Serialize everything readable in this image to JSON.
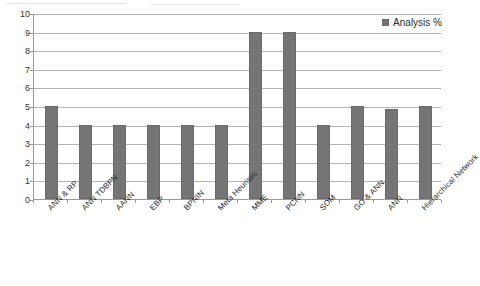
{
  "chart_data": {
    "type": "bar",
    "title": "",
    "xlabel": "",
    "ylabel": "",
    "ylim": [
      0,
      10
    ],
    "ytick_step": 1,
    "grid": true,
    "legend_position": "top-right",
    "bar_color": "#757575",
    "gridline_color": "#b4b4b4",
    "axis_color": "#9a9a9a",
    "categories": [
      "ANN & RP",
      "ANN TDBPN",
      "AANN",
      "EBP",
      "BPNIN",
      "Meta Heuristic",
      "MME",
      "PCNN",
      "SOM",
      "GO & ANN",
      "ANN",
      "Hierarchical Network"
    ],
    "series": [
      {
        "name": "Analysis %",
        "values": [
          5,
          4,
          4,
          4,
          4,
          4,
          9,
          9,
          4,
          5,
          4.85,
          5
        ]
      }
    ],
    "ytick_labels": [
      "10",
      "9",
      "8",
      "7",
      "6",
      "5",
      "4",
      "3",
      "2",
      "1",
      "0"
    ]
  },
  "legend": {
    "items": [
      {
        "label": "Analysis %",
        "color": "#757575"
      }
    ]
  }
}
